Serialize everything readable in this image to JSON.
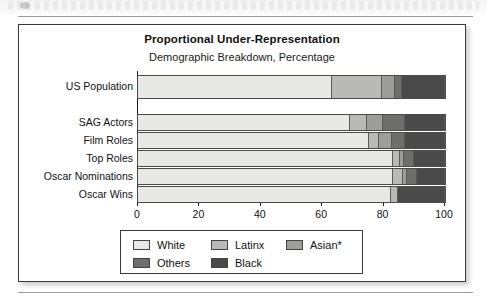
{
  "page": {
    "top_strip_note": ""
  },
  "chart": {
    "title": "Proportional Under-Representation",
    "subtitle": "Demographic Breakdown, Percentage"
  },
  "legend": {
    "rows": [
      [
        {
          "label": "White",
          "color": "#e8e8e6"
        },
        {
          "label": "Latinx",
          "color": "#b9b9b7"
        },
        {
          "label": "Asian*",
          "color": "#9d9d9b"
        }
      ],
      [
        {
          "label": "Others",
          "color": "#6e6e6c"
        },
        {
          "label": "Black",
          "color": "#4a4a4a"
        }
      ]
    ]
  },
  "chart_data": {
    "type": "bar",
    "orientation": "horizontal",
    "stacked": true,
    "title": "Proportional Under-Representation",
    "subtitle": "Demographic Breakdown, Percentage",
    "xlabel": "",
    "ylabel": "",
    "xlim": [
      0,
      100
    ],
    "xticks": [
      0,
      20,
      40,
      60,
      80,
      100
    ],
    "xtick_labels": [
      "0",
      "20",
      "40",
      "60",
      "80",
      "100"
    ],
    "grid": false,
    "legend_position": "bottom",
    "categories": [
      "US Population",
      "SAG Actors",
      "Film Roles",
      "Top Roles",
      "Oscar Nominations",
      "Oscar Wins"
    ],
    "series": [
      {
        "name": "White",
        "color": "#e8e8e6",
        "values": [
          64,
          70,
          76,
          84,
          84,
          83
        ]
      },
      {
        "name": "Latinx",
        "color": "#b9b9b7",
        "values": [
          16,
          5,
          3,
          2,
          3,
          2
        ]
      },
      {
        "name": "Asian*",
        "color": "#9d9d9b",
        "values": [
          4,
          5,
          4,
          1,
          1,
          0
        ]
      },
      {
        "name": "Others",
        "color": "#6e6e6c",
        "values": [
          2,
          7,
          4,
          3,
          3,
          0
        ]
      },
      {
        "name": "Black",
        "color": "#4a4a4a",
        "values": [
          14,
          13,
          13,
          10,
          9,
          15
        ]
      }
    ]
  }
}
